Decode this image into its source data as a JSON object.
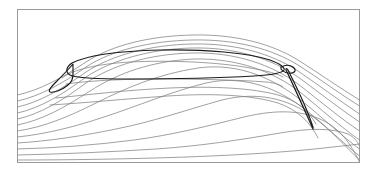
{
  "figure": {
    "title": "",
    "background_color": "#ffffff",
    "width": 377,
    "height": 172
  },
  "frame": {
    "x": 17.5,
    "y": 9.5,
    "width": 342,
    "height": 153,
    "stroke_color": "#9a9a9a",
    "stroke_width": 1,
    "fill": "#ffffff"
  },
  "style": {
    "streamline_color": "#808080",
    "streamline_width": 0.75,
    "separatrix_color": "#1a1a1a",
    "separatrix_width": 1.15
  },
  "chart_data": {
    "type": "line",
    "title": "",
    "xlabel": "",
    "ylabel": "",
    "xlim": [
      17.5,
      359.5
    ],
    "ylim": [
      9.5,
      162.5
    ],
    "grid": false,
    "legend": null,
    "series": [
      {
        "name": "streamline-01",
        "role": "streamline",
        "path": "M 17.5 95 C 40 90, 62 78, 86 62 C 112 45, 150 36, 192 35 C 236 34, 272 44, 298 60 C 320 74, 340 88, 359.5 100"
      },
      {
        "name": "streamline-02",
        "role": "streamline",
        "path": "M 17.5 101 C 40 96, 62 84, 86 67 C 112 50, 150 41, 192 40 C 236 39, 272 49, 298 65 C 320 79, 340 94, 359.5 106"
      },
      {
        "name": "streamline-03",
        "role": "streamline",
        "path": "M 17.5 107 C 40 102, 62 89, 86 72 C 112 55, 150 45, 192 44 C 236 43, 272 54, 298 71 C 320 86, 340 101, 359.5 114"
      },
      {
        "name": "streamline-04",
        "role": "streamline",
        "path": "M 17.5 113 C 40 108, 62 95, 86 77 C 112 60, 150 49, 192 48 C 236 47, 272 59, 298 77 C 320 93, 340 109, 359.5 122"
      },
      {
        "name": "streamline-05",
        "role": "streamline",
        "path": "M 17.5 119 C 40 114, 62 101, 86 83 C 112 65, 150 54, 192 53 C 236 52, 272 65, 298 84 C 320 101, 340 118, 359.5 131"
      },
      {
        "name": "streamline-06",
        "role": "streamline",
        "path": "M 17.5 125 C 42 120, 64 108, 90 91 C 118 73, 152 61, 194 59 C 238 58, 274 72, 300 92 C 322 110, 341 127, 359.5 140"
      },
      {
        "name": "streamline-07",
        "role": "streamline",
        "path": "M 17.5 131 C 44 127, 68 117, 96 103 C 126 88, 158 74, 198 68 C 240 62, 276 80, 302 101 C 324 119, 342 136, 359.5 149"
      },
      {
        "name": "streamline-08",
        "role": "streamline",
        "path": "M 17.5 137 C 46 134, 74 127, 104 117 C 138 106, 170 92, 206 83 C 246 74, 280 90, 306 110 C 327 127, 343 143, 359.5 156"
      },
      {
        "name": "streamline-09",
        "role": "streamline",
        "path": "M 17.5 143 C 50 141, 82 136, 116 129 C 152 122, 186 110, 222 100 C 258 91, 288 99, 312 116 C 331 130, 345 146, 359.5 160"
      },
      {
        "name": "streamline-10",
        "role": "streamline",
        "path": "M 17.5 149 C 56 148, 96 145, 134 140 C 172 135, 208 126, 244 117 C 278 109, 304 110, 326 122 C 340 130, 350 142, 359.5 162"
      },
      {
        "name": "streamline-11",
        "role": "streamline",
        "path": "M 17.5 155 C 62 154, 110 152, 156 149 C 200 146, 240 140, 280 133 C 310 128, 332 128, 348 134 C 354 137, 357 141, 359.5 146"
      },
      {
        "name": "streamline-12",
        "role": "streamline",
        "path": "M 17.5 160 C 70 160, 130 159, 186 157 C 240 155, 288 152, 324 148 C 342 146, 352 145, 359.5 144"
      },
      {
        "name": "bubble-inner-upper",
        "role": "streamline",
        "path": "M 62 78 C 72 70, 96 64, 130 62 C 170 60, 218 62, 250 68 C 268 71, 278 74, 283 77"
      },
      {
        "name": "bubble-inner-lower",
        "role": "streamline",
        "path": "M 66 84 C 86 81, 120 79, 160 79 C 200 79, 240 80, 266 82 C 276 83, 281 85, 283 87"
      },
      {
        "name": "shear-layer-lower",
        "role": "streamline",
        "path": "M 56 98 C 86 95, 126 90, 170 88 C 214 86, 252 88, 278 95 C 296 100, 308 110, 316 124"
      },
      {
        "name": "shear-layer-lower-2",
        "role": "streamline",
        "path": "M 50 105 C 84 103, 124 99, 168 96 C 212 93, 252 95, 278 103 C 298 110, 310 122, 318 138"
      },
      {
        "name": "tail-vortex-inner",
        "role": "streamline",
        "path": "M 288 74 C 294 86, 300 100, 308 116 C 311 122, 313 126, 314 128"
      },
      {
        "name": "leading-bubble-separatrix",
        "role": "separatrix",
        "path": "M 73 64 C 68 70, 62 76, 56 82 C 50 88, 48 91, 50 92 C 54 93, 62 90, 68 85 C 72 82, 73 78, 73 74 C 73 70, 73 66, 73 64 Z"
      },
      {
        "name": "main-bubble-separatrix",
        "role": "separatrix",
        "path": "M 72 63 C 86 56, 118 51, 160 50 C 206 49, 248 53, 270 60 C 281 64, 285 68, 284 70 C 282 73, 272 75, 254 76 C 220 78, 170 79, 128 79 C 96 79, 76 78, 70 75 C 65 72, 66 67, 72 63 Z"
      },
      {
        "name": "trailing-vortex-separatrix",
        "role": "separatrix",
        "path": "M 286 70 C 291 80, 297 94, 304 109 C 309 120, 312 127, 313 129 C 313 127, 310 118, 305 106 C 299 92, 292 78, 288 70 C 287 68, 286 68, 286 70 Z"
      },
      {
        "name": "trailing-vortex-cap",
        "role": "separatrix",
        "path": "M 281 67 C 285 65, 290 65, 293 67 C 296 69, 296 72, 292 73 C 288 74, 283 72, 281 69 Z"
      }
    ]
  }
}
